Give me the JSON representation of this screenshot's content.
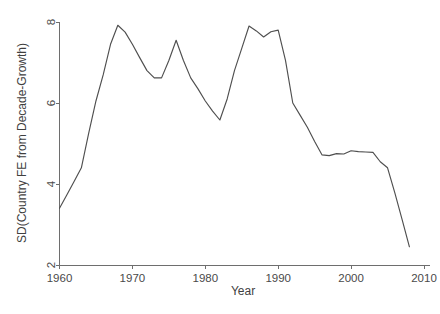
{
  "chart_data": {
    "type": "line",
    "title": "",
    "xlabel": "Year",
    "ylabel": "SD(Country FE from Decade-Growth)",
    "xlim": [
      1958,
      2011
    ],
    "ylim": [
      2,
      8
    ],
    "xticks": [
      1960,
      1970,
      1980,
      1990,
      2000,
      2010
    ],
    "xtick_labels": [
      "1960",
      "1970",
      "1980",
      "1990",
      "2000",
      "2010"
    ],
    "yticks": [
      2,
      4,
      6,
      8
    ],
    "ytick_labels": [
      "2",
      "4",
      "6",
      "8"
    ],
    "grid": false,
    "legend": null,
    "line_color": "#4f4f4f",
    "background_color": "#ffffff",
    "axis_color": "#6e6e6e",
    "series": [
      {
        "name": "SD(Country FE from Decade-Growth)",
        "x": [
          1960,
          1961,
          1962,
          1963,
          1964,
          1965,
          1966,
          1967,
          1968,
          1969,
          1970,
          1971,
          1972,
          1973,
          1974,
          1975,
          1976,
          1977,
          1978,
          1979,
          1980,
          1981,
          1982,
          1983,
          1984,
          1985,
          1986,
          1987,
          1988,
          1989,
          1990,
          1991,
          1992,
          1993,
          1994,
          1995,
          1996,
          1997,
          1998,
          1999,
          2000,
          2001,
          2002,
          2003,
          2004,
          2005,
          2006,
          2007,
          2008
        ],
        "values": [
          3.4,
          3.73,
          4.06,
          4.4,
          5.25,
          6.05,
          6.7,
          7.45,
          7.92,
          7.75,
          7.45,
          7.12,
          6.8,
          6.62,
          6.62,
          7.05,
          7.55,
          7.05,
          6.62,
          6.35,
          6.05,
          5.8,
          5.58,
          6.1,
          6.8,
          7.35,
          7.9,
          7.78,
          7.63,
          7.76,
          7.8,
          7.05,
          6.0,
          5.7,
          5.4,
          5.05,
          4.72,
          4.7,
          4.75,
          4.74,
          4.82,
          4.8,
          4.79,
          4.78,
          4.55,
          4.4,
          3.78,
          3.12,
          2.45
        ]
      }
    ]
  },
  "axis": {
    "y_title": "SD(Country FE from Decade-Growth)",
    "x_title": "Year"
  }
}
